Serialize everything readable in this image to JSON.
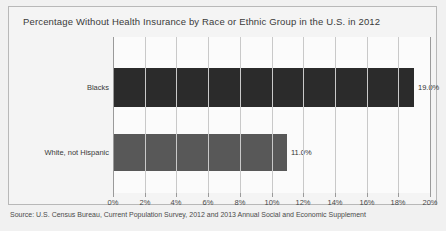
{
  "chart_data": {
    "type": "bar",
    "orientation": "horizontal",
    "title": "Percentage Without Health Insurance by Race or Ethnic Group in the U.S. in 2012",
    "xlabel": "",
    "ylabel": "",
    "categories": [
      "Blacks",
      "White, not Hispanic"
    ],
    "values": [
      19.0,
      11.0
    ],
    "value_labels": [
      "19.0%",
      "11.0%"
    ],
    "bar_colors": [
      "#2b2b2b",
      "#585858"
    ],
    "xlim": [
      0,
      20
    ],
    "xticks": [
      0,
      2,
      4,
      6,
      8,
      10,
      12,
      14,
      16,
      18,
      20
    ],
    "xtick_labels": [
      "0%",
      "2%",
      "4%",
      "6%",
      "8%",
      "10%",
      "12%",
      "14%",
      "16%",
      "18%",
      "20%"
    ],
    "grid": "vertical",
    "legend": "none",
    "source": "Source: U.S. Census Bureau, Current Population Survey, 2012 and 2013 Annual Social and Economic Supplement"
  },
  "colors": {
    "page_background": "#f1f1f1",
    "frame_border": "#b8b8b8",
    "plot_background": "#fbfbfb",
    "gridline": "#c9c9c9",
    "axis_line": "#9a9a9a",
    "text": "#3a3a3a"
  }
}
